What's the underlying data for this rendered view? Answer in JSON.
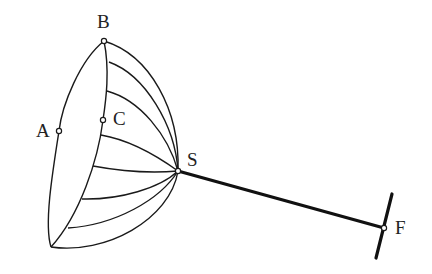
{
  "diagram": {
    "title": "",
    "labels": {
      "A": "A",
      "B": "B",
      "C": "C",
      "S": "S",
      "F": "F"
    },
    "points": {
      "A": {
        "x": 59,
        "y": 131
      },
      "B": {
        "x": 104,
        "y": 41
      },
      "C": {
        "x": 103,
        "y": 120
      },
      "S": {
        "x": 178,
        "y": 171
      },
      "F": {
        "x": 384,
        "y": 228
      }
    },
    "meridian_count": 8,
    "colors": {
      "line": "#1a1a1a",
      "background": "#ffffff"
    }
  }
}
